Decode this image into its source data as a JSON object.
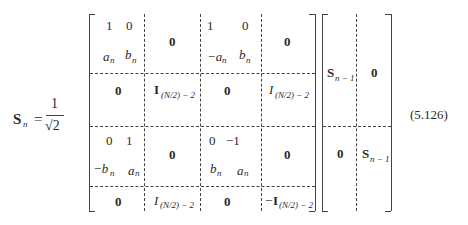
{
  "equation": {
    "lhs_symbol": "S",
    "lhs_subscript": "n",
    "equals": "=",
    "fraction_numerator": "1",
    "fraction_denominator": "√2",
    "number": "(5.126)"
  },
  "left_matrix": {
    "block_11": {
      "row1": [
        "1",
        "0"
      ],
      "row2": [
        "a",
        "b"
      ],
      "row2_subscripts": [
        "n",
        "n"
      ]
    },
    "block_12": "0",
    "block_13": {
      "row1": [
        "1",
        "0"
      ],
      "row2": [
        "−a",
        "b"
      ],
      "row2_subscripts": [
        "n",
        "n"
      ]
    },
    "block_14": "0",
    "block_21": "0",
    "block_22": {
      "symbol": "I",
      "subscript": "(N/2) − 2"
    },
    "block_23": "0",
    "block_24": {
      "symbol": "I",
      "subscript": "(N/2) − 2"
    },
    "block_31": {
      "row1": [
        "0",
        "1"
      ],
      "row2": [
        "−b",
        "a"
      ],
      "row2_subscripts": [
        "n",
        "n"
      ]
    },
    "block_32": "0",
    "block_33": {
      "row1": [
        "0",
        "−1"
      ],
      "row2": [
        "b",
        "a"
      ],
      "row2_subscripts": [
        "n",
        "n"
      ]
    },
    "block_34": "0",
    "block_41": "0",
    "block_42": {
      "symbol": "I",
      "subscript": "(N/2) − 2"
    },
    "block_43": "0",
    "block_44": {
      "prefix": "−",
      "symbol": "I",
      "subscript": "(N/2) − 2"
    }
  },
  "right_matrix": {
    "block_11": {
      "symbol": "S",
      "subscript": "n − 1"
    },
    "block_12": "0",
    "block_21": "0",
    "block_22": {
      "symbol": "S",
      "subscript": "n − 1"
    }
  }
}
